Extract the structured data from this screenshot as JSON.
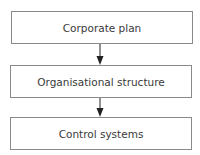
{
  "diagram": {
    "type": "flowchart",
    "direction": "top-to-bottom",
    "nodes": [
      {
        "id": "n1",
        "label": "Corporate plan"
      },
      {
        "id": "n2",
        "label": "Organisational structure"
      },
      {
        "id": "n3",
        "label": "Control systems"
      }
    ],
    "edges": [
      {
        "from": "n1",
        "to": "n2"
      },
      {
        "from": "n2",
        "to": "n3"
      }
    ],
    "colors": {
      "border": "#8a8a8a",
      "text": "#3a3a3a",
      "arrow": "#222222"
    }
  }
}
